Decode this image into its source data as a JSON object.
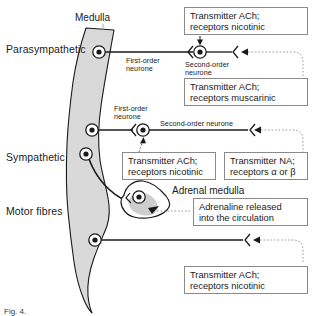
{
  "figure": {
    "title_caption": "Fig. 4.",
    "row_labels": [
      {
        "id": "parasympathetic",
        "text": "Parasympathetic"
      },
      {
        "id": "sympathetic",
        "text": "Sympathetic"
      },
      {
        "id": "motor-fibres",
        "text": "Motor fibres"
      }
    ],
    "structures": [
      {
        "id": "medulla",
        "text": "Medulla"
      },
      {
        "id": "adrenal-medulla",
        "text": "Adrenal medulla"
      }
    ],
    "neurone_labels": [
      {
        "id": "para-first-order",
        "line1": "First-order",
        "line2": "neurone"
      },
      {
        "id": "para-second-order",
        "line1": "Second-order",
        "line2": "neurone"
      },
      {
        "id": "symp-first-order",
        "line1": "First-order",
        "line2": "neurone"
      },
      {
        "id": "symp-second-order",
        "line1": "Second-order neurone",
        "line2": ""
      }
    ],
    "callouts": [
      {
        "id": "para-ganglion-callout",
        "line1": "Transmitter  ACh;",
        "line2": "receptors nicotinic"
      },
      {
        "id": "para-target-callout",
        "line1": "Transmitter  ACh;",
        "line2": "receptors muscarinic"
      },
      {
        "id": "symp-ganglion-callout",
        "line1": "Transmitter ACh;",
        "line2": "receptors nicotinic"
      },
      {
        "id": "symp-target-callout",
        "line1": "Transmitter NA;",
        "line2": "receptors α or β"
      },
      {
        "id": "adrenaline-callout",
        "line1": "Adrenaline released",
        "line2": "into the circulation"
      },
      {
        "id": "motor-callout",
        "line1": "Transmitter ACh;",
        "line2": "receptors nicotinic"
      }
    ],
    "colors": {
      "cord_fill": "#d9d9d9",
      "stroke": "#1a1a1a",
      "box_border": "#8a8a8a",
      "dotted": "#9a9a9a",
      "text": "#1a1a1a"
    }
  }
}
